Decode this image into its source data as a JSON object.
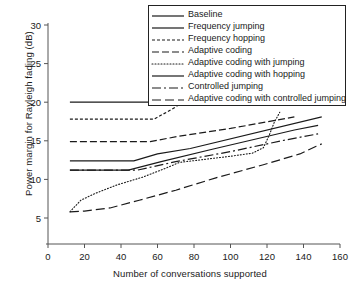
{
  "chart_data": {
    "type": "line",
    "title": "",
    "xlabel": "Number of conversations supported",
    "ylabel": "Power margin for Rayleigh fading (dB)",
    "xlim": [
      0,
      160
    ],
    "ylim": [
      0,
      30
    ],
    "xticks": [
      0,
      20,
      40,
      60,
      80,
      100,
      120,
      140,
      160
    ],
    "yticks": [
      5,
      10,
      15,
      20,
      25,
      30
    ],
    "grid": false,
    "legend_position": "top-right",
    "series": [
      {
        "name": "Baseline",
        "style": "solid",
        "points": [
          [
            12,
            20.0
          ],
          [
            57,
            20.0
          ]
        ]
      },
      {
        "name": "Frequency jumping",
        "style": "solid",
        "points": [
          [
            12,
            12.4
          ],
          [
            47,
            12.4
          ],
          [
            60,
            13.3
          ],
          [
            78,
            14.0
          ],
          [
            150,
            18.1
          ]
        ]
      },
      {
        "name": "Frequency hopping",
        "style": "dashed-fine",
        "points": [
          [
            12,
            17.8
          ],
          [
            58,
            17.8
          ],
          [
            68,
            19.1
          ],
          [
            74,
            20.0
          ]
        ]
      },
      {
        "name": "Adaptive coding",
        "style": "dashed",
        "points": [
          [
            12,
            14.9
          ],
          [
            56,
            14.9
          ],
          [
            72,
            15.6
          ],
          [
            100,
            16.6
          ],
          [
            135,
            18.1
          ]
        ]
      },
      {
        "name": "Adaptive coding with jumping",
        "style": "dotted",
        "points": [
          [
            12,
            5.8
          ],
          [
            18,
            7.3
          ],
          [
            26,
            8.2
          ],
          [
            38,
            9.3
          ],
          [
            52,
            10.3
          ],
          [
            64,
            11.4
          ],
          [
            72,
            12.2
          ],
          [
            86,
            12.6
          ],
          [
            100,
            13.0
          ],
          [
            112,
            13.4
          ],
          [
            118,
            14.1
          ],
          [
            121,
            15.6
          ],
          [
            124,
            17.4
          ],
          [
            127,
            18.7
          ]
        ]
      },
      {
        "name": "Adaptive coding with hopping",
        "style": "solid",
        "points": [
          [
            12,
            11.2
          ],
          [
            44,
            11.2
          ],
          [
            62,
            12.3
          ],
          [
            90,
            13.9
          ],
          [
            135,
            16.4
          ],
          [
            148,
            17.0
          ]
        ]
      },
      {
        "name": "Controlled jumping",
        "style": "dash-dot",
        "points": [
          [
            12,
            11.2
          ],
          [
            49,
            11.2
          ],
          [
            70,
            12.3
          ],
          [
            100,
            13.6
          ],
          [
            130,
            15.1
          ],
          [
            148,
            15.9
          ]
        ]
      },
      {
        "name": "Adaptive coding with controlled jumping",
        "style": "dashed-long",
        "points": [
          [
            12,
            5.8
          ],
          [
            20,
            5.9
          ],
          [
            34,
            6.3
          ],
          [
            50,
            7.3
          ],
          [
            70,
            8.6
          ],
          [
            92,
            10.2
          ],
          [
            118,
            11.9
          ],
          [
            138,
            13.3
          ],
          [
            147,
            14.3
          ],
          [
            150,
            14.6
          ]
        ]
      }
    ]
  },
  "axes": {
    "y_tick_labels": [
      "30",
      "25",
      "20",
      "15",
      "10",
      "5"
    ],
    "x_tick_labels": [
      "0",
      "20",
      "40",
      "60",
      "80",
      "100",
      "120",
      "140",
      "160"
    ],
    "y_axis_title": "Power margin for Rayleigh fading (dB)",
    "x_axis_title": "Number of conversations supported"
  },
  "legend": {
    "items": [
      {
        "label": "Baseline",
        "style": "solid"
      },
      {
        "label": "Frequency jumping",
        "style": "solid"
      },
      {
        "label": "Frequency hopping",
        "style": "dashed-fine"
      },
      {
        "label": "Adaptive coding",
        "style": "dashed"
      },
      {
        "label": "Adaptive coding with jumping",
        "style": "dotted"
      },
      {
        "label": "Adaptive coding with hopping",
        "style": "solid"
      },
      {
        "label": "Controlled jumping",
        "style": "dash-dot"
      },
      {
        "label": "Adaptive coding with controlled jumping",
        "style": "dashed-long"
      }
    ]
  },
  "colors": {
    "line": "#1a1a1a",
    "axis": "#555555",
    "background": "#ffffff"
  }
}
